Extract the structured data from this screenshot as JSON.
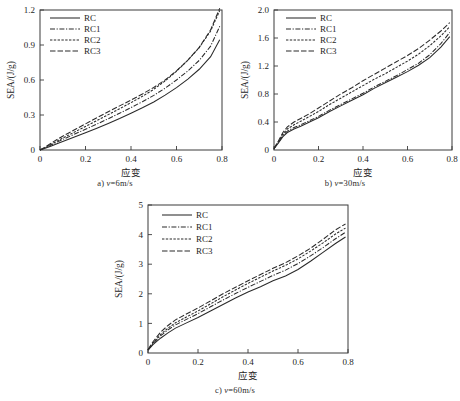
{
  "figure": {
    "panels": [
      {
        "id": "a",
        "caption_prefix": "a)",
        "caption_var": "v",
        "caption_value": "=6m/s",
        "caption_full": "a) v=6m/s"
      },
      {
        "id": "b",
        "caption_prefix": "b)",
        "caption_var": "v",
        "caption_value": "=30m/s",
        "caption_full": "b) v=30m/s"
      },
      {
        "id": "c",
        "caption_prefix": "c)",
        "caption_var": "v",
        "caption_value": "=60m/s",
        "caption_full": "c) v=60m/s"
      }
    ],
    "legend_labels": [
      "RC",
      "RC1",
      "RC2",
      "RC3"
    ],
    "axis_label_x": "应变",
    "axis_label_y": "SEA/(J/g)"
  },
  "chart_data": [
    {
      "type": "line",
      "title": "a) v=6m/s",
      "xlabel": "应变",
      "ylabel": "SEA/(J/g)",
      "xlim": [
        0,
        0.8
      ],
      "ylim": [
        0,
        1.2
      ],
      "xticks": [
        0,
        0.2,
        0.4,
        0.6,
        0.8
      ],
      "yticks": [
        0,
        0.3,
        0.6,
        0.9,
        1.2
      ],
      "xtick_labels": [
        "0",
        "0.2",
        "0.4",
        "0.6",
        "0.8"
      ],
      "ytick_labels": [
        "0",
        "0.3",
        "0.6",
        "0.9",
        "1.2"
      ],
      "grid": false,
      "legend_position": "upper left",
      "x": [
        0,
        0.02,
        0.05,
        0.08,
        0.12,
        0.16,
        0.2,
        0.25,
        0.3,
        0.35,
        0.4,
        0.45,
        0.5,
        0.55,
        0.6,
        0.65,
        0.7,
        0.75,
        0.79
      ],
      "series": [
        {
          "name": "RC",
          "style": "solid",
          "values": [
            0,
            0.012,
            0.035,
            0.058,
            0.088,
            0.118,
            0.148,
            0.187,
            0.228,
            0.27,
            0.315,
            0.362,
            0.412,
            0.47,
            0.535,
            0.608,
            0.692,
            0.8,
            0.945
          ]
        },
        {
          "name": "RC1",
          "style": "dashdot",
          "values": [
            0,
            0.016,
            0.044,
            0.072,
            0.108,
            0.143,
            0.178,
            0.222,
            0.268,
            0.315,
            0.364,
            0.414,
            0.468,
            0.53,
            0.6,
            0.678,
            0.768,
            0.89,
            1.06
          ]
        },
        {
          "name": "RC2",
          "style": "dotted",
          "values": [
            0,
            0.018,
            0.05,
            0.082,
            0.122,
            0.162,
            0.202,
            0.252,
            0.303,
            0.354,
            0.406,
            0.46,
            0.52,
            0.592,
            0.675,
            0.77,
            0.878,
            1.02,
            1.195
          ]
        },
        {
          "name": "RC3",
          "style": "longdash",
          "values": [
            0,
            0.022,
            0.06,
            0.096,
            0.14,
            0.182,
            0.224,
            0.276,
            0.328,
            0.378,
            0.428,
            0.48,
            0.536,
            0.6,
            0.678,
            0.77,
            0.88,
            1.03,
            1.215
          ]
        }
      ]
    },
    {
      "type": "line",
      "title": "b) v=30m/s",
      "xlabel": "应变",
      "ylabel": "SEA/(J/g)",
      "xlim": [
        0,
        0.8
      ],
      "ylim": [
        0,
        2.0
      ],
      "xticks": [
        0,
        0.2,
        0.4,
        0.6,
        0.8
      ],
      "yticks": [
        0,
        0.4,
        0.8,
        1.2,
        1.6,
        2.0
      ],
      "xtick_labels": [
        "0",
        "0.2",
        "0.4",
        "0.6",
        "0.8"
      ],
      "ytick_labels": [
        "0",
        "0.4",
        "0.8",
        "1.2",
        "1.6",
        "2.0"
      ],
      "grid": false,
      "legend_position": "upper left",
      "x": [
        0,
        0.02,
        0.04,
        0.06,
        0.09,
        0.12,
        0.16,
        0.2,
        0.25,
        0.3,
        0.35,
        0.4,
        0.45,
        0.5,
        0.55,
        0.6,
        0.65,
        0.7,
        0.75,
        0.79
      ],
      "series": [
        {
          "name": "RC",
          "style": "solid",
          "values": [
            0.02,
            0.1,
            0.19,
            0.25,
            0.3,
            0.34,
            0.4,
            0.46,
            0.55,
            0.63,
            0.71,
            0.79,
            0.88,
            0.96,
            1.04,
            1.12,
            1.21,
            1.32,
            1.47,
            1.62
          ]
        },
        {
          "name": "RC1",
          "style": "dashdot",
          "values": [
            0.02,
            0.11,
            0.21,
            0.27,
            0.32,
            0.36,
            0.42,
            0.48,
            0.57,
            0.65,
            0.73,
            0.81,
            0.9,
            0.98,
            1.06,
            1.15,
            1.24,
            1.36,
            1.52,
            1.68
          ]
        },
        {
          "name": "RC2",
          "style": "dotted",
          "values": [
            0.02,
            0.12,
            0.23,
            0.3,
            0.36,
            0.41,
            0.48,
            0.55,
            0.65,
            0.74,
            0.83,
            0.92,
            1.01,
            1.09,
            1.18,
            1.27,
            1.37,
            1.49,
            1.63,
            1.76
          ]
        },
        {
          "name": "RC3",
          "style": "longdash",
          "values": [
            0.02,
            0.13,
            0.25,
            0.33,
            0.4,
            0.45,
            0.52,
            0.6,
            0.7,
            0.8,
            0.89,
            0.99,
            1.08,
            1.17,
            1.26,
            1.35,
            1.45,
            1.57,
            1.7,
            1.82
          ]
        }
      ]
    },
    {
      "type": "line",
      "title": "c) v=60m/s",
      "xlabel": "应变",
      "ylabel": "SEA/(J/g)",
      "xlim": [
        0,
        0.8
      ],
      "ylim": [
        0,
        5
      ],
      "xticks": [
        0,
        0.2,
        0.4,
        0.6,
        0.8
      ],
      "yticks": [
        0,
        1,
        2,
        3,
        4,
        5
      ],
      "xtick_labels": [
        "0",
        "0.2",
        "0.4",
        "0.6",
        "0.8"
      ],
      "ytick_labels": [
        "0",
        "1",
        "2",
        "3",
        "4",
        "5"
      ],
      "grid": false,
      "legend_position": "upper left",
      "x": [
        0,
        0.02,
        0.05,
        0.08,
        0.11,
        0.15,
        0.2,
        0.25,
        0.3,
        0.35,
        0.4,
        0.45,
        0.5,
        0.55,
        0.6,
        0.65,
        0.7,
        0.75,
        0.79
      ],
      "series": [
        {
          "name": "RC",
          "style": "solid",
          "values": [
            0.1,
            0.28,
            0.5,
            0.68,
            0.84,
            1.0,
            1.2,
            1.42,
            1.64,
            1.86,
            2.06,
            2.24,
            2.44,
            2.6,
            2.82,
            3.1,
            3.4,
            3.7,
            3.92
          ]
        },
        {
          "name": "RC1",
          "style": "dashdot",
          "values": [
            0.1,
            0.32,
            0.58,
            0.78,
            0.95,
            1.12,
            1.33,
            1.56,
            1.79,
            2.01,
            2.22,
            2.42,
            2.62,
            2.8,
            3.02,
            3.28,
            3.56,
            3.86,
            4.08
          ]
        },
        {
          "name": "RC2",
          "style": "dotted",
          "values": [
            0.1,
            0.34,
            0.62,
            0.84,
            1.02,
            1.2,
            1.42,
            1.66,
            1.9,
            2.13,
            2.35,
            2.56,
            2.77,
            2.96,
            3.18,
            3.44,
            3.72,
            4.02,
            4.22
          ]
        },
        {
          "name": "RC3",
          "style": "longdash",
          "values": [
            0.12,
            0.38,
            0.7,
            0.93,
            1.12,
            1.3,
            1.52,
            1.76,
            2.0,
            2.22,
            2.44,
            2.65,
            2.86,
            3.05,
            3.28,
            3.54,
            3.84,
            4.16,
            4.36
          ]
        }
      ]
    }
  ]
}
